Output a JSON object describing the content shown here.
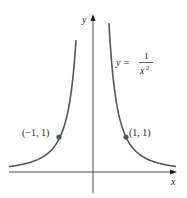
{
  "figure": {
    "function_label": {
      "lhs": "y =",
      "numerator": "1",
      "denominator_base": "x",
      "denominator_exp": "2"
    },
    "x_axis_label": "x",
    "y_axis_label": "y",
    "points": [
      {
        "label": "(−1, 1)",
        "x": -1,
        "y": 1
      },
      {
        "label": "(1, 1)",
        "x": 1,
        "y": 1
      }
    ],
    "colors": {
      "curve": "#55565a",
      "axis": "#231f20",
      "point": "#55565a",
      "text": "#231f20"
    }
  }
}
